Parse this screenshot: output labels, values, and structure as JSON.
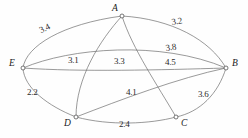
{
  "figure": {
    "type": "weighted-graph-diagram",
    "background": "#fefefe",
    "edge_color": "#6f6f6f",
    "node_color": "#ffffff",
    "text_color": "#1a1a1a",
    "width": 248,
    "height": 138
  },
  "nodes": [
    {
      "id": "A",
      "label": "A",
      "x": 122,
      "y": 16,
      "label_x": 112,
      "label_y": 4
    },
    {
      "id": "E",
      "label": "E",
      "x": 23,
      "y": 68,
      "label_x": 9,
      "label_y": 59
    },
    {
      "id": "B",
      "label": "B",
      "x": 226,
      "y": 68,
      "label_x": 232,
      "label_y": 59
    },
    {
      "id": "D",
      "label": "D",
      "x": 76,
      "y": 117,
      "label_x": 64,
      "label_y": 119
    },
    {
      "id": "C",
      "label": "C",
      "x": 176,
      "y": 117,
      "label_x": 181,
      "label_y": 119
    }
  ],
  "edges": [
    {
      "from": "E",
      "to": "A",
      "weight": "3.4",
      "label_x": 38,
      "label_y": 27,
      "rotation": -26
    },
    {
      "from": "A",
      "to": "B",
      "weight": "3.2",
      "label_x": 171,
      "label_y": 18,
      "rotation": -9
    },
    {
      "from": "E",
      "to": "B",
      "weight": "3.8",
      "label_x": 165,
      "label_y": 44,
      "rotation": -8
    },
    {
      "from": "A",
      "to": "D",
      "weight": "3.1",
      "label_x": 68,
      "label_y": 56,
      "rotation": 0
    },
    {
      "from": "A",
      "to": "C",
      "weight": "3.3",
      "label_x": 114,
      "label_y": 57,
      "rotation": 0
    },
    {
      "from": "E",
      "to": "B",
      "weight": "4.5",
      "label_x": 165,
      "label_y": 58,
      "rotation": 0
    },
    {
      "from": "E",
      "to": "D",
      "weight": "2.2",
      "label_x": 27,
      "label_y": 88,
      "rotation": 0
    },
    {
      "from": "D",
      "to": "B",
      "weight": "4.1",
      "label_x": 126,
      "label_y": 88,
      "rotation": 0
    },
    {
      "from": "C",
      "to": "B",
      "weight": "3.6",
      "label_x": 198,
      "label_y": 90,
      "rotation": 0
    },
    {
      "from": "D",
      "to": "C",
      "weight": "2.4",
      "label_x": 119,
      "label_y": 120,
      "rotation": 0
    }
  ],
  "edge_paths": [
    {
      "name": "edge-E-A",
      "d": "M 23,68 C 26,46 62,24 122,16"
    },
    {
      "name": "edge-A-B",
      "d": "M 122,16 C 172,19 210,40 226,68"
    },
    {
      "name": "edge-E-B-upper",
      "d": "M 23,68 C 70,48 160,40 226,68"
    },
    {
      "name": "edge-E-B-lower",
      "d": "M 23,68 C 80,72 160,70 226,68"
    },
    {
      "name": "edge-A-D",
      "d": "M 122,16 C 100,40 76,78 76,117"
    },
    {
      "name": "edge-A-C",
      "d": "M 122,16 C 132,48 158,86 176,117"
    },
    {
      "name": "edge-E-D",
      "d": "M 23,68 C 24,88 48,106 76,117"
    },
    {
      "name": "edge-D-B",
      "d": "M 76,117 C 120,100 178,78 226,68"
    },
    {
      "name": "edge-C-B",
      "d": "M 176,117 C 200,112 218,94 226,68"
    },
    {
      "name": "edge-D-C",
      "d": "M 76,117 C 110,126 150,124 176,117"
    }
  ],
  "chart_data": {
    "type": "diagram",
    "title": "",
    "nodes": [
      "A",
      "B",
      "C",
      "D",
      "E"
    ],
    "edges": [
      {
        "endpoints": [
          "E",
          "A"
        ],
        "weight": 3.4
      },
      {
        "endpoints": [
          "A",
          "B"
        ],
        "weight": 3.2
      },
      {
        "endpoints": [
          "E",
          "B"
        ],
        "weight": 3.8
      },
      {
        "endpoints": [
          "A",
          "D"
        ],
        "weight": 3.1
      },
      {
        "endpoints": [
          "A",
          "C"
        ],
        "weight": 3.3
      },
      {
        "endpoints": [
          "E",
          "B"
        ],
        "weight": 4.5
      },
      {
        "endpoints": [
          "E",
          "D"
        ],
        "weight": 2.2
      },
      {
        "endpoints": [
          "D",
          "B"
        ],
        "weight": 4.1
      },
      {
        "endpoints": [
          "C",
          "B"
        ],
        "weight": 3.6
      },
      {
        "endpoints": [
          "D",
          "C"
        ],
        "weight": 2.4
      }
    ]
  }
}
